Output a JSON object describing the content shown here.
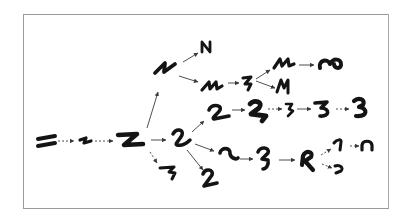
{
  "diagram": {
    "type": "glyph-evolution-tree",
    "frame": {
      "x": 23,
      "y": 14,
      "width": 366,
      "height": 195,
      "border_color": "#9a9a9a"
    },
    "ink_color": "#141414",
    "arrow_color": "#3a3a3a",
    "nodes": [
      {
        "id": "n0",
        "shape": "double-bar",
        "x": 47,
        "y": 142
      },
      {
        "id": "n1",
        "shape": "small-zigzag",
        "x": 85,
        "y": 141
      },
      {
        "id": "n2",
        "shape": "Z",
        "x": 128,
        "y": 140
      },
      {
        "id": "n3",
        "shape": "2-cursive",
        "x": 180,
        "y": 139
      },
      {
        "id": "n4",
        "shape": "3-flat",
        "x": 168,
        "y": 173
      },
      {
        "id": "n5",
        "shape": "N-slanted",
        "x": 164,
        "y": 68
      },
      {
        "id": "n6",
        "shape": "N",
        "x": 206,
        "y": 47
      },
      {
        "id": "n7",
        "shape": "M-slanted",
        "x": 212,
        "y": 85
      },
      {
        "id": "n8",
        "shape": "Z-narrow",
        "x": 247,
        "y": 82
      },
      {
        "id": "n9",
        "shape": "M-slanted",
        "x": 283,
        "y": 64
      },
      {
        "id": "n10",
        "shape": "M-slanted",
        "x": 283,
        "y": 86
      },
      {
        "id": "n11",
        "shape": "omega",
        "x": 330,
        "y": 63
      },
      {
        "id": "n12",
        "shape": "2",
        "x": 218,
        "y": 113
      },
      {
        "id": "n13",
        "shape": "2-heavy",
        "x": 257,
        "y": 110
      },
      {
        "id": "n14",
        "shape": "3-small",
        "x": 290,
        "y": 109
      },
      {
        "id": "n15",
        "shape": "3",
        "x": 323,
        "y": 108
      },
      {
        "id": "n16",
        "shape": "3-bold",
        "x": 361,
        "y": 108
      },
      {
        "id": "n17",
        "shape": "2-upright",
        "x": 210,
        "y": 180
      },
      {
        "id": "n18",
        "shape": "2-round",
        "x": 228,
        "y": 155
      },
      {
        "id": "n19",
        "shape": "2-tall",
        "x": 265,
        "y": 157
      },
      {
        "id": "n20",
        "shape": "R-like",
        "x": 309,
        "y": 160
      },
      {
        "id": "n21",
        "shape": "1-hook",
        "x": 338,
        "y": 145
      },
      {
        "id": "n22",
        "shape": "c-reversed",
        "x": 340,
        "y": 168
      },
      {
        "id": "n23",
        "shape": "n-arch",
        "x": 367,
        "y": 145
      }
    ],
    "edges": [
      {
        "from": "n0",
        "to": "n1",
        "style": "dashed"
      },
      {
        "from": "n1",
        "to": "n2",
        "style": "dashed"
      },
      {
        "from": "n2",
        "to": "n3",
        "style": "solid"
      },
      {
        "from": "n2",
        "to": "n4",
        "style": "dashed"
      },
      {
        "from": "n2",
        "to": "n5",
        "style": "solid"
      },
      {
        "from": "n5",
        "to": "n6",
        "style": "solid"
      },
      {
        "from": "n5",
        "to": "n7",
        "style": "solid"
      },
      {
        "from": "n7",
        "to": "n8",
        "style": "solid"
      },
      {
        "from": "n8",
        "to": "n9",
        "style": "solid"
      },
      {
        "from": "n8",
        "to": "n10",
        "style": "solid"
      },
      {
        "from": "n9",
        "to": "n11",
        "style": "solid"
      },
      {
        "from": "n3",
        "to": "n12",
        "style": "solid"
      },
      {
        "from": "n12",
        "to": "n13",
        "style": "solid"
      },
      {
        "from": "n13",
        "to": "n14",
        "style": "dashed"
      },
      {
        "from": "n14",
        "to": "n15",
        "style": "solid"
      },
      {
        "from": "n15",
        "to": "n16",
        "style": "dashed"
      },
      {
        "from": "n3",
        "to": "n17",
        "style": "solid"
      },
      {
        "from": "n3",
        "to": "n18",
        "style": "solid"
      },
      {
        "from": "n18",
        "to": "n19",
        "style": "solid"
      },
      {
        "from": "n19",
        "to": "n20",
        "style": "solid"
      },
      {
        "from": "n20",
        "to": "n21",
        "style": "dashed"
      },
      {
        "from": "n20",
        "to": "n22",
        "style": "dashed"
      },
      {
        "from": "n21",
        "to": "n23",
        "style": "dashed"
      }
    ]
  }
}
